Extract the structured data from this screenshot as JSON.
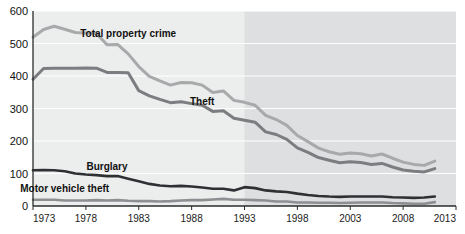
{
  "chart_data": {
    "type": "line",
    "title": "",
    "xlabel": "",
    "ylabel": "",
    "xlim": [
      1973,
      2013
    ],
    "ylim": [
      0,
      600
    ],
    "grid": true,
    "legend_position": "inline-labels",
    "x_ticks": [
      "1973",
      "1978",
      "1983",
      "1988",
      "1993",
      "1998",
      "2003",
      "2008",
      "2013"
    ],
    "y_ticks": [
      "0",
      "100",
      "200",
      "300",
      "400",
      "500",
      "600"
    ],
    "shaded_region": {
      "from": 1993,
      "to": 2013,
      "color": "#dedfe0"
    },
    "plot_background": "#eceded",
    "x": [
      1973,
      1974,
      1975,
      1976,
      1977,
      1978,
      1979,
      1980,
      1981,
      1982,
      1983,
      1984,
      1985,
      1986,
      1987,
      1988,
      1989,
      1990,
      1991,
      1992,
      1993,
      1994,
      1995,
      1996,
      1997,
      1998,
      1999,
      2000,
      2001,
      2002,
      2003,
      2004,
      2005,
      2006,
      2007,
      2008,
      2009,
      2010,
      2011
    ],
    "series": [
      {
        "name": "Total property crime",
        "color": "#a8a9ab",
        "width": 3.0,
        "label_x": 1982,
        "label_y": 520,
        "values": [
          519,
          543,
          553,
          544,
          534,
          532,
          531,
          496,
          497,
          468,
          429,
          399,
          385,
          372,
          380,
          379,
          372,
          349,
          354,
          325,
          319,
          310,
          279,
          266,
          248,
          217,
          198,
          178,
          167,
          159,
          163,
          161,
          154,
          160,
          147,
          135,
          128,
          125,
          138
        ]
      },
      {
        "name": "Theft",
        "color": "#7b7d80",
        "width": 3.0,
        "label_x": 1989,
        "label_y": 312,
        "values": [
          390,
          423,
          424,
          424,
          424,
          425,
          424,
          411,
          411,
          410,
          355,
          339,
          328,
          318,
          321,
          315,
          310,
          291,
          293,
          270,
          264,
          258,
          228,
          220,
          205,
          179,
          165,
          149,
          141,
          133,
          136,
          134,
          128,
          131,
          120,
          111,
          107,
          105,
          115
        ]
      },
      {
        "name": "Burglary",
        "color": "#2f3033",
        "width": 2.6,
        "label_x": 1980,
        "label_y": 112,
        "values": [
          110,
          111,
          110,
          107,
          100,
          97,
          95,
          92,
          92,
          84,
          76,
          68,
          63,
          61,
          62,
          60,
          57,
          53,
          53,
          48,
          58,
          55,
          48,
          45,
          43,
          38,
          34,
          31,
          29,
          28,
          29,
          29,
          29,
          29,
          27,
          26,
          25,
          26,
          29
        ]
      },
      {
        "name": "Motor vehicle theft",
        "color": "#8d8f92",
        "width": 2.6,
        "label_x": 1976,
        "label_y": 42,
        "values": [
          19,
          19,
          19,
          17,
          17,
          17,
          18,
          17,
          18,
          16,
          15,
          15,
          14,
          15,
          17,
          18,
          18,
          20,
          22,
          19,
          19,
          18,
          17,
          14,
          14,
          11,
          11,
          10,
          10,
          9,
          10,
          11,
          11,
          11,
          9,
          8,
          7,
          7,
          12
        ]
      }
    ]
  },
  "plot_geometry": {
    "left": 33,
    "right": 456,
    "top": 11,
    "bottom": 206
  }
}
